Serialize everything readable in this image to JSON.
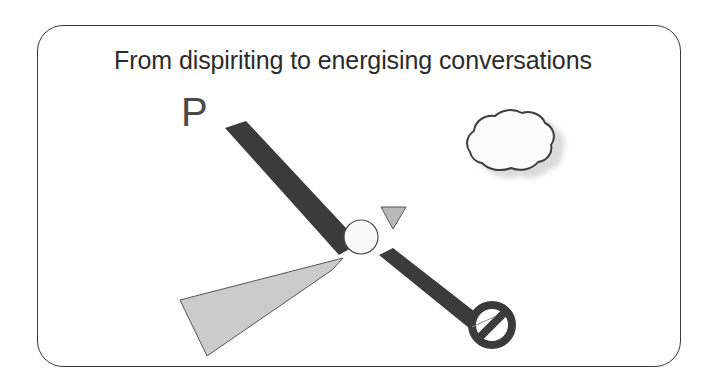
{
  "slide": {
    "title": "From dispiriting to energising conversations",
    "annotation_letter": "P",
    "frame": {
      "border_color": "#3a3a3a",
      "corner_radius": "26px",
      "background": "#ffffff"
    }
  },
  "colors": {
    "dark_blade": "#3b3b3b",
    "light_blade": "#cbcbcb",
    "triangle_fill": "#b9b9b9",
    "hub_fill": "#fafafa",
    "outline": "#555555",
    "title_text": "#2b2b2b",
    "letter_text": "#4a4a4a",
    "cloud_fill": "#fbfbfb",
    "cloud_outline": "#3d3d3d",
    "cloud_shadow": "#bdbdbd",
    "prohibit_sign": "#3b3b3b"
  },
  "shapes": {
    "dark_blade_upper_left": {
      "name": "dark-blade-upper-left",
      "points": "225,128 245,122 358,242 338,254",
      "fill": "#3b3b3b"
    },
    "dark_blade_lower_right": {
      "name": "dark-blade-lower-right",
      "points": "381,256 394,250 478,316 468,327",
      "fill": "#3b3b3b"
    },
    "light_blade_lower_left": {
      "name": "light-blade-lower-left",
      "points": "343,258 180,300 207,356 330,268",
      "fill": "#cbcbcb"
    },
    "hub": {
      "name": "hub-circle",
      "cx": 361,
      "cy": 237,
      "r": 17,
      "fill": "#fafafa"
    },
    "triangle": {
      "name": "small-triangle-marker",
      "points": "381,207 406,207 393,229",
      "fill": "#b9b9b9"
    },
    "cloud": {
      "name": "cloud-shape",
      "center_x": 508,
      "center_y": 149,
      "width": 100,
      "height": 62
    },
    "prohibition_sign": {
      "name": "prohibition-sign",
      "cx": 492,
      "cy": 325,
      "r": 22,
      "slash_angle_deg": 45
    }
  }
}
